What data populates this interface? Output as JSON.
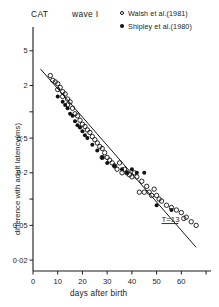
{
  "figure": {
    "title_left": "CAT",
    "title_right": "wave I",
    "annotation": "T=13"
  },
  "legend": {
    "entries": [
      {
        "marker": "open-circle-marker",
        "label": "Walsh et al.(1981)"
      },
      {
        "marker": "filled-circle-marker",
        "label": "Shipley et al.(1980)"
      }
    ]
  },
  "chart_data": {
    "type": "scatter",
    "title": "CAT   wave I",
    "xlabel": "days after birth",
    "ylabel": "difference with adult latency(ms)",
    "xlim": [
      0,
      72
    ],
    "ylim": [
      0.015,
      8
    ],
    "yscale": "log",
    "xscale": "linear",
    "grid": false,
    "legend_position": "top-right",
    "xticks": [
      0,
      10,
      20,
      30,
      40,
      50,
      60,
      70
    ],
    "xticklabels": [
      "0",
      "10",
      "20",
      "30",
      "40",
      "50",
      "60",
      ""
    ],
    "yticks": [
      5,
      2,
      1,
      0.5,
      0.2,
      0.1,
      0.05,
      0.02
    ],
    "yticklabels": [
      "5",
      "2",
      "",
      "0·5",
      "0·2",
      "",
      "0·05",
      "0·02"
    ],
    "annotations": [
      {
        "text": "T=13",
        "x": 52,
        "y": 0.055,
        "underlined": true
      }
    ],
    "fit_line": {
      "label": "exponential decay fit",
      "x": [
        3,
        66
      ],
      "y": [
        3.1,
        0.028
      ]
    },
    "series": [
      {
        "name": "Walsh et al.(1981)",
        "marker": "open-circle",
        "x": [
          7,
          8,
          9,
          10,
          10,
          11,
          12,
          12,
          13,
          14,
          14,
          15,
          16,
          17,
          18,
          19,
          20,
          21,
          22,
          23,
          24,
          25,
          26,
          27,
          28,
          28,
          29,
          30,
          31,
          32,
          33,
          34,
          35,
          36,
          37,
          38,
          39,
          40,
          41,
          42,
          43,
          44,
          45,
          46,
          47,
          48,
          49,
          50,
          51,
          52,
          54,
          56,
          58,
          60,
          61,
          62,
          64,
          66
        ],
        "y": [
          2.6,
          2.3,
          2.2,
          2.1,
          1.8,
          1.9,
          1.7,
          1.5,
          1.6,
          1.4,
          1.2,
          1.3,
          1.1,
          0.95,
          0.9,
          0.8,
          0.72,
          0.68,
          0.62,
          0.58,
          0.52,
          0.48,
          0.44,
          0.4,
          0.38,
          0.3,
          0.34,
          0.3,
          0.28,
          0.26,
          0.24,
          0.22,
          0.26,
          0.2,
          0.22,
          0.2,
          0.19,
          0.18,
          0.2,
          0.18,
          0.12,
          0.16,
          0.12,
          0.14,
          0.12,
          0.11,
          0.13,
          0.11,
          0.1,
          0.095,
          0.085,
          0.08,
          0.075,
          0.07,
          0.06,
          0.062,
          0.055,
          0.05
        ]
      },
      {
        "name": "Shipley et al.(1980)",
        "marker": "filled-circle",
        "x": [
          10,
          12,
          13,
          14,
          15,
          16,
          17,
          18,
          19,
          20,
          21,
          22,
          24,
          26,
          28,
          30,
          33,
          36,
          38,
          40,
          42,
          45,
          50,
          56
        ],
        "y": [
          1.5,
          1.3,
          1.2,
          1.1,
          0.95,
          0.9,
          0.78,
          0.7,
          0.66,
          0.6,
          0.54,
          0.5,
          0.42,
          0.36,
          0.3,
          0.26,
          0.24,
          0.22,
          0.2,
          0.22,
          0.2,
          0.2,
          0.085,
          0.075
        ]
      }
    ]
  }
}
